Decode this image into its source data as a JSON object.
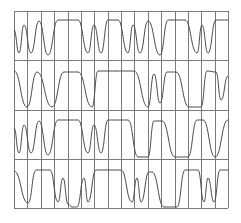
{
  "diagram": {
    "type": "waveform-grid",
    "background": "#ffffff",
    "grid_color": "#7a7a7a",
    "wave_color": "#4a4a4a",
    "grid": {
      "left": 14,
      "top": 11,
      "right": 228,
      "bottom": 208,
      "columns": 16,
      "rows": 4
    },
    "rows": [
      {
        "name": "trace-1",
        "points": [
          [
            14,
            30
          ],
          [
            19,
            53
          ],
          [
            24,
            25
          ],
          [
            31,
            53
          ],
          [
            39,
            21
          ],
          [
            48,
            55
          ],
          [
            58,
            20
          ],
          [
            78,
            20
          ],
          [
            88,
            53
          ],
          [
            94,
            25
          ],
          [
            101,
            53
          ],
          [
            108,
            20
          ],
          [
            118,
            20
          ],
          [
            128,
            53
          ],
          [
            133,
            25
          ],
          [
            140,
            53
          ],
          [
            148,
            21
          ],
          [
            160,
            55
          ],
          [
            168,
            20
          ],
          [
            185,
            20
          ],
          [
            197,
            53
          ],
          [
            202,
            25
          ],
          [
            208,
            53
          ],
          [
            216,
            20
          ],
          [
            228,
            20
          ]
        ]
      },
      {
        "name": "trace-2",
        "points": [
          [
            14,
            71
          ],
          [
            27,
            107
          ],
          [
            37,
            72
          ],
          [
            52,
            107
          ],
          [
            64,
            72
          ],
          [
            78,
            72
          ],
          [
            92,
            107
          ],
          [
            98,
            71
          ],
          [
            134,
            71
          ],
          [
            148,
            107
          ],
          [
            154,
            74
          ],
          [
            160,
            103
          ],
          [
            167,
            72
          ],
          [
            176,
            72
          ],
          [
            189,
            107
          ],
          [
            201,
            107
          ],
          [
            207,
            71
          ],
          [
            216,
            72
          ],
          [
            221,
            100
          ],
          [
            228,
            76
          ]
        ]
      },
      {
        "name": "trace-3",
        "points": [
          [
            14,
            128
          ],
          [
            19,
            153
          ],
          [
            24,
            125
          ],
          [
            31,
            153
          ],
          [
            39,
            121
          ],
          [
            48,
            155
          ],
          [
            58,
            120
          ],
          [
            78,
            120
          ],
          [
            88,
            153
          ],
          [
            94,
            125
          ],
          [
            101,
            153
          ],
          [
            108,
            120
          ],
          [
            128,
            120
          ],
          [
            138,
            157
          ],
          [
            148,
            157
          ],
          [
            154,
            121
          ],
          [
            162,
            121
          ],
          [
            175,
            157
          ],
          [
            188,
            157
          ],
          [
            197,
            120
          ],
          [
            203,
            120
          ],
          [
            215,
            157
          ],
          [
            228,
            120
          ]
        ]
      },
      {
        "name": "trace-4",
        "points": [
          [
            14,
            171
          ],
          [
            28,
            203
          ],
          [
            36,
            170
          ],
          [
            50,
            170
          ],
          [
            58,
            202
          ],
          [
            63,
            178
          ],
          [
            68,
            204
          ],
          [
            72,
            207
          ],
          [
            77,
            207
          ],
          [
            84,
            178
          ],
          [
            88,
            202
          ],
          [
            96,
            170
          ],
          [
            121,
            170
          ],
          [
            132,
            202
          ],
          [
            137,
            178
          ],
          [
            141,
            202
          ],
          [
            149,
            172
          ],
          [
            152,
            172
          ],
          [
            164,
            207
          ],
          [
            177,
            207
          ],
          [
            185,
            170
          ],
          [
            198,
            170
          ],
          [
            204,
            202
          ],
          [
            208,
            178
          ],
          [
            214,
            202
          ],
          [
            220,
            170
          ],
          [
            228,
            170
          ]
        ]
      }
    ]
  }
}
